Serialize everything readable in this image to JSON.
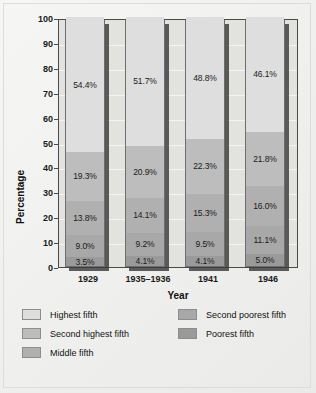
{
  "chart_data": {
    "type": "bar",
    "subtype": "stacked-bar-100",
    "title": "",
    "xlabel": "Year",
    "ylabel": "Percentage",
    "categories": [
      "1929",
      "1935–1936",
      "1941",
      "1946"
    ],
    "ylim": [
      0,
      100
    ],
    "yticks": [
      "0",
      "10",
      "20",
      "30",
      "40",
      "50",
      "60",
      "70",
      "80",
      "90",
      "100"
    ],
    "grid": true,
    "legend_position": "bottom",
    "series": [
      {
        "name": "Poorest fifth",
        "color": "#9a9a9a",
        "values": [
          3.5,
          4.1,
          4.1,
          5.0
        ],
        "labels": [
          "3.5%",
          "4.1%",
          "4.1%",
          "5.0%"
        ]
      },
      {
        "name": "Second poorest fifth",
        "color": "#a8a8a8",
        "values": [
          9.0,
          9.2,
          9.5,
          11.1
        ],
        "labels": [
          "9.0%",
          "9.2%",
          "9.5%",
          "11.1%"
        ]
      },
      {
        "name": "Middle fifth",
        "color": "#b0b0b0",
        "values": [
          13.8,
          14.1,
          15.3,
          16.0
        ],
        "labels": [
          "13.8%",
          "14.1%",
          "15.3%",
          "16.0%"
        ]
      },
      {
        "name": "Second highest fifth",
        "color": "#bdbdbd",
        "values": [
          19.3,
          20.9,
          22.3,
          21.8
        ],
        "labels": [
          "19.3%",
          "20.9%",
          "22.3%",
          "21.8%"
        ]
      },
      {
        "name": "Highest fifth",
        "color": "#dedede",
        "values": [
          54.4,
          51.7,
          48.8,
          46.1
        ],
        "labels": [
          "54.4%",
          "51.7%",
          "48.8%",
          "46.1%"
        ]
      }
    ]
  },
  "legend": {
    "entries": [
      {
        "label": "Highest fifth",
        "color": "#dedede"
      },
      {
        "label": "Second highest fifth",
        "color": "#bdbdbd"
      },
      {
        "label": "Middle fifth",
        "color": "#b0b0b0"
      },
      {
        "label": "Second poorest fifth",
        "color": "#a8a8a8"
      },
      {
        "label": "Poorest fifth",
        "color": "#9a9a9a"
      }
    ]
  }
}
